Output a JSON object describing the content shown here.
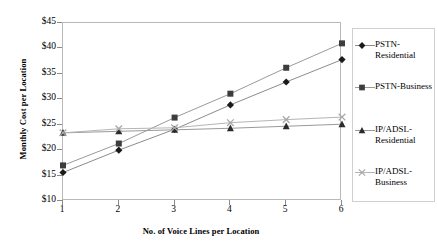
{
  "chart_data": {
    "type": "line",
    "title": "",
    "xlabel": "No. of Voice Lines per Location",
    "ylabel": "Monthly Cost per Location",
    "x": [
      1,
      2,
      3,
      4,
      5,
      6
    ],
    "xtick_labels": [
      "1",
      "2",
      "3",
      "4",
      "5",
      "6"
    ],
    "ytick_labels": [
      "$10",
      "$15",
      "$20",
      "$25",
      "$30",
      "$35",
      "$40",
      "$45"
    ],
    "ytick_values": [
      10,
      15,
      20,
      25,
      30,
      35,
      40,
      45
    ],
    "xlim": [
      1,
      6
    ],
    "ylim": [
      10,
      45
    ],
    "grid": false,
    "legend_position": "right",
    "series": [
      {
        "name": "PSTN-Residential",
        "marker": "diamond",
        "color": "#1a1a1a",
        "line_color": "#8c8c8c",
        "values": [
          15.6,
          20.0,
          24.1,
          28.9,
          33.4,
          37.8
        ]
      },
      {
        "name": "PSTN-Business",
        "marker": "square",
        "color": "#3d3d3d",
        "line_color": "#9a9a9a",
        "values": [
          17.0,
          21.3,
          26.4,
          31.1,
          36.2,
          41.0
        ]
      },
      {
        "name": "IP/ADSL-Residential",
        "marker": "triangle",
        "color": "#2b2b2b",
        "line_color": "#9a9a9a",
        "values": [
          23.4,
          23.7,
          24.0,
          24.3,
          24.7,
          25.1
        ]
      },
      {
        "name": "IP/ADSL-Business",
        "marker": "cross",
        "color": "#a8a8a8",
        "line_color": "#b5b5b5",
        "values": [
          23.4,
          24.2,
          24.4,
          25.4,
          26.0,
          26.5
        ]
      }
    ]
  },
  "legend": {
    "items": [
      {
        "label": "PSTN-Residential"
      },
      {
        "label": "PSTN-Business"
      },
      {
        "label": "IP/ADSL-Residential"
      },
      {
        "label": "IP/ADSL-Business"
      }
    ]
  }
}
